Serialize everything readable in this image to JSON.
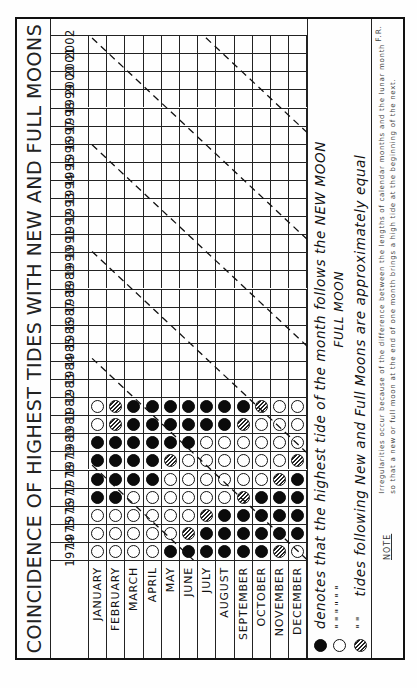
{
  "title": "COINCIDENCE OF HIGHEST TIDES WITH NEW AND FULL MOONS",
  "months": [
    "JANUARY",
    "FEBRUARY",
    "MARCH",
    "APRIL",
    "MAY",
    "JUNE",
    "JULY",
    "AUGUST",
    "SEPTEMBER",
    "OCTOBER",
    "NOVEMBER",
    "DECEMBER"
  ],
  "years": [
    "1974",
    "1975",
    "1976",
    "1977",
    "1978",
    "1979",
    "1980",
    "1981",
    "1982",
    "1983",
    "1984",
    "1985",
    "1986",
    "1987",
    "1988",
    "1989",
    "1990",
    "1991",
    "1992",
    "1993",
    "1994",
    "1995",
    "1996",
    "1997",
    "1998",
    "1999",
    "2000",
    "2001",
    "2002"
  ],
  "legend": {
    "new": {
      "symbol": "filled-circle",
      "text": "denotes that the highest tide of the month follows the NEW MOON"
    },
    "full": {
      "symbol": "open-circle",
      "ditto": "\"         \"         \"         \"         \"         \"",
      "text": "FULL MOON"
    },
    "equal": {
      "symbol": "hatched-circle",
      "ditto": "\"         \"",
      "text": "tides following New and Full Moons are approximately equal"
    }
  },
  "note": {
    "label": "NOTE",
    "line1": "Irregularities occur because of the difference between the lengths of calendar months and the lunar month",
    "line2": "so that a new or full moon at the end of one month brings a high tide at the beginning of the next.",
    "initials": "F.R."
  },
  "colors": {
    "ink": "#111111",
    "paper": "#fefefe"
  },
  "chart_data": {
    "type": "table",
    "title": "COINCIDENCE OF HIGHEST TIDES WITH NEW AND FULL MOONS",
    "legend": {
      "N": "highest tide follows the NEW MOON",
      "F": "highest tide follows the FULL MOON",
      "E": "tides following New and Full Moons are approximately equal",
      "": "no data (empty cell)"
    },
    "columns": [
      "JANUARY",
      "FEBRUARY",
      "MARCH",
      "APRIL",
      "MAY",
      "JUNE",
      "JULY",
      "AUGUST",
      "SEPTEMBER",
      "OCTOBER",
      "NOVEMBER",
      "DECEMBER"
    ],
    "rows": {
      "1974": [
        "F",
        "F",
        "F",
        "F",
        "N",
        "N",
        "N",
        "N",
        "N",
        "N",
        "E",
        "F"
      ],
      "1975": [
        "F",
        "F",
        "F",
        "F",
        "F",
        "E",
        "N",
        "N",
        "N",
        "N",
        "N",
        "N"
      ],
      "1976": [
        "F",
        "F",
        "F",
        "F",
        "F",
        "F",
        "E",
        "N",
        "N",
        "N",
        "N",
        "N"
      ],
      "1977": [
        "N",
        "N",
        "F",
        "F",
        "F",
        "F",
        "F",
        "F",
        "E",
        "N",
        "N",
        "N"
      ],
      "1978": [
        "N",
        "N",
        "N",
        "N",
        "F",
        "F",
        "F",
        "F",
        "F",
        "F",
        "E",
        "N"
      ],
      "1979": [
        "N",
        "N",
        "N",
        "N",
        "E",
        "F",
        "F",
        "F",
        "F",
        "F",
        "F",
        "E"
      ],
      "1980": [
        "N",
        "N",
        "N",
        "N",
        "N",
        "N",
        "F",
        "F",
        "F",
        "F",
        "F",
        "F"
      ],
      "1981": [
        "F",
        "E",
        "N",
        "N",
        "N",
        "N",
        "N",
        "N",
        "E",
        "F",
        "F",
        "F"
      ],
      "1982": [
        "F",
        "E",
        "N",
        "N",
        "N",
        "N",
        "N",
        "N",
        "N",
        "E",
        "F",
        "F"
      ],
      "1983": [
        "",
        "",
        "",
        "",
        "",
        "",
        "",
        "",
        "",
        "",
        "",
        ""
      ],
      "1984": [
        "",
        "",
        "",
        "",
        "",
        "",
        "",
        "",
        "",
        "",
        "",
        ""
      ],
      "1985": [
        "",
        "",
        "",
        "",
        "",
        "",
        "",
        "",
        "",
        "",
        "",
        ""
      ],
      "1986": [
        "",
        "",
        "",
        "",
        "",
        "",
        "",
        "",
        "",
        "",
        "",
        ""
      ],
      "1987": [
        "",
        "",
        "",
        "",
        "",
        "",
        "",
        "",
        "",
        "",
        "",
        ""
      ],
      "1988": [
        "",
        "",
        "",
        "",
        "",
        "",
        "",
        "",
        "",
        "",
        "",
        ""
      ],
      "1989": [
        "",
        "",
        "",
        "",
        "",
        "",
        "",
        "",
        "",
        "",
        "",
        ""
      ],
      "1990": [
        "",
        "",
        "",
        "",
        "",
        "",
        "",
        "",
        "",
        "",
        "",
        ""
      ],
      "1991": [
        "",
        "",
        "",
        "",
        "",
        "",
        "",
        "",
        "",
        "",
        "",
        ""
      ],
      "1992": [
        "",
        "",
        "",
        "",
        "",
        "",
        "",
        "",
        "",
        "",
        "",
        ""
      ],
      "1993": [
        "",
        "",
        "",
        "",
        "",
        "",
        "",
        "",
        "",
        "",
        "",
        ""
      ],
      "1994": [
        "",
        "",
        "",
        "",
        "",
        "",
        "",
        "",
        "",
        "",
        "",
        ""
      ],
      "1995": [
        "",
        "",
        "",
        "",
        "",
        "",
        "",
        "",
        "",
        "",
        "",
        ""
      ],
      "1996": [
        "",
        "",
        "",
        "",
        "",
        "",
        "",
        "",
        "",
        "",
        "",
        ""
      ],
      "1997": [
        "",
        "",
        "",
        "",
        "",
        "",
        "",
        "",
        "",
        "",
        "",
        ""
      ],
      "1998": [
        "",
        "",
        "",
        "",
        "",
        "",
        "",
        "",
        "",
        "",
        "",
        ""
      ],
      "1999": [
        "",
        "",
        "",
        "",
        "",
        "",
        "",
        "",
        "",
        "",
        "",
        ""
      ],
      "2000": [
        "",
        "",
        "",
        "",
        "",
        "",
        "",
        "",
        "",
        "",
        "",
        ""
      ],
      "2001": [
        "",
        "",
        "",
        "",
        "",
        "",
        "",
        "",
        "",
        "",
        "",
        ""
      ],
      "2002": [
        "",
        "",
        "",
        "",
        "",
        "",
        "",
        "",
        "",
        "",
        "",
        ""
      ]
    },
    "annotations": "Dashed diagonal guide lines mark the transition between New-Moon and Full-Moon periods, drifting about one month earlier each year (~every 3 years per diagonal step)."
  }
}
